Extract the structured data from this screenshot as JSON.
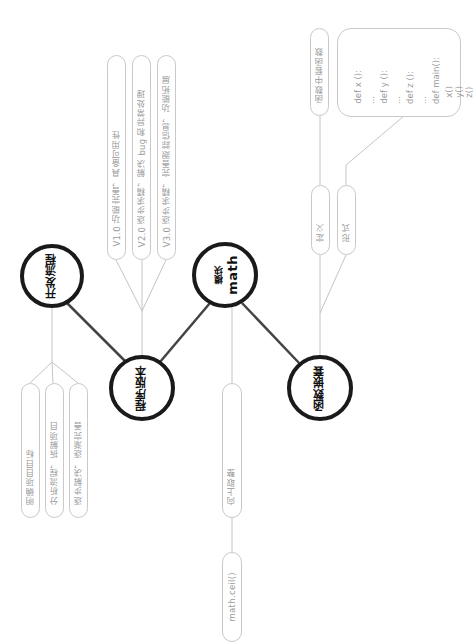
{
  "hubs": {
    "dev_process": {
      "label": "开发流程"
    },
    "versions": {
      "label": "程序版本"
    },
    "math_module": {
      "label_main": "math",
      "label_sub": "模块"
    },
    "nested_functions": {
      "label": "函数嵌套"
    }
  },
  "dev_process_leaves": [
    {
      "label": "明确项目目标"
    },
    {
      "label": "分析流程，拆解项目"
    },
    {
      "label": "逐步解决，逐渐完善"
    }
  ],
  "version_leaves": [
    {
      "label": "V1.0 功能完善，具备可用性"
    },
    {
      "label": "V2.0 逐步求精，解决 bug 和异常处理"
    },
    {
      "label": "V3.0 逐步求精，完善跟踪信息，功能拓展"
    }
  ],
  "math_leaves": {
    "ceil_desc": "向上取整",
    "ceil_func": "math.ceil()"
  },
  "nested_leaves": {
    "definition": "定义",
    "definition_detail": "函数中套函数",
    "form": "形式",
    "code_lines": [
      "def x ():",
      "...",
      "def y ():",
      "...",
      "def z ():",
      "...",
      "def main():",
      "x()",
      "y()",
      "z()"
    ]
  },
  "colors": {
    "hub_stroke": "#1a1a1a",
    "main_link": "#444444",
    "leaf_link": "#c4c4c4",
    "leaf_border": "#c9c9c9",
    "leaf_text": "#9a9a9a"
  }
}
